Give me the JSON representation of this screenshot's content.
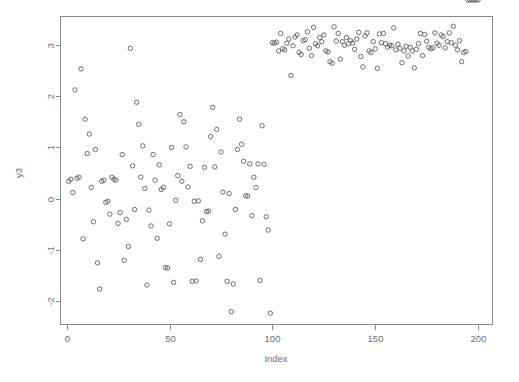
{
  "chart_data": {
    "type": "scatter",
    "title": "",
    "xlabel": "Index",
    "ylabel": "y3",
    "xlim": [
      -3,
      207
    ],
    "ylim": [
      -2.45,
      3.55
    ],
    "grid": false,
    "legend": null,
    "marker": "open-circle",
    "marker_color": "#5d5d5d",
    "xticks": [
      0,
      50,
      100,
      150,
      200
    ],
    "yticks": [
      -2,
      -1,
      0,
      1,
      2,
      3
    ],
    "xtick_labels": [
      "0",
      "50",
      "100",
      "150",
      "200"
    ],
    "ytick_labels": [
      "-2",
      "-1",
      "0",
      "1",
      "2",
      "3"
    ],
    "x": [
      1,
      2,
      3,
      4,
      5,
      6,
      7,
      8,
      9,
      10,
      11,
      12,
      13,
      14,
      15,
      16,
      17,
      18,
      19,
      20,
      21,
      22,
      23,
      24,
      25,
      26,
      27,
      28,
      29,
      30,
      31,
      32,
      33,
      34,
      35,
      36,
      37,
      38,
      39,
      40,
      41,
      42,
      43,
      44,
      45,
      46,
      47,
      48,
      49,
      50,
      51,
      52,
      53,
      54,
      55,
      56,
      57,
      58,
      59,
      60,
      61,
      62,
      63,
      64,
      65,
      66,
      67,
      68,
      69,
      70,
      71,
      72,
      73,
      74,
      75,
      76,
      77,
      78,
      79,
      80,
      81,
      82,
      83,
      84,
      85,
      86,
      87,
      88,
      89,
      90,
      91,
      92,
      93,
      94,
      95,
      96,
      97,
      98,
      99,
      100,
      101,
      102,
      103,
      104,
      105,
      106,
      107,
      108,
      109,
      110,
      111,
      112,
      113,
      114,
      115,
      116,
      117,
      118,
      119,
      120,
      121,
      122,
      123,
      124,
      125,
      126,
      127,
      128,
      129,
      130,
      131,
      132,
      133,
      134,
      135,
      136,
      137,
      138,
      139,
      140,
      141,
      142,
      143,
      144,
      145,
      146,
      147,
      148,
      149,
      150,
      151,
      152,
      153,
      154,
      155,
      156,
      157,
      158,
      159,
      160,
      161,
      162,
      163,
      164,
      165,
      166,
      167,
      168,
      169,
      170,
      171,
      172,
      173,
      174,
      175,
      176,
      177,
      178,
      179,
      180,
      181,
      182,
      183,
      184,
      185,
      186,
      187,
      188,
      189,
      190,
      191,
      192,
      193,
      194,
      195,
      196,
      197,
      198,
      199,
      200
    ],
    "y": [
      0.34,
      0.38,
      0.12,
      2.12,
      0.4,
      0.42,
      2.53,
      -0.78,
      1.55,
      0.88,
      1.26,
      0.22,
      -0.45,
      0.96,
      -1.25,
      -1.76,
      0.34,
      0.36,
      -0.07,
      -0.05,
      -0.3,
      0.42,
      0.38,
      0.36,
      -0.48,
      -0.27,
      0.86,
      -1.2,
      -0.4,
      -0.93,
      2.93,
      0.64,
      -0.21,
      1.88,
      1.45,
      0.42,
      1.03,
      0.2,
      -1.68,
      -0.22,
      -0.53,
      0.86,
      0.36,
      -0.77,
      0.66,
      0.18,
      0.22,
      -1.34,
      -1.35,
      -0.49,
      1.0,
      -1.63,
      -0.03,
      0.45,
      1.64,
      0.34,
      1.5,
      1.01,
      0.23,
      0.63,
      -1.61,
      -0.05,
      -1.6,
      -0.04,
      -1.18,
      -0.43,
      0.61,
      -0.25,
      -0.24,
      1.21,
      1.78,
      0.62,
      1.35,
      -1.12,
      0.91,
      0.13,
      -0.69,
      -1.61,
      0.1,
      -2.2,
      -1.66,
      -0.21,
      0.96,
      1.55,
      1.06,
      0.73,
      0.06,
      0.05,
      0.68,
      -0.33,
      0.42,
      0.22,
      0.68,
      -1.59,
      1.42,
      0.67,
      -0.35,
      -0.61,
      -2.23,
      3.04,
      3.03,
      3.05,
      2.88,
      3.22,
      2.92,
      2.9,
      3.03,
      3.11,
      2.4,
      2.98,
      3.15,
      3.19,
      2.85,
      2.81,
      3.08,
      3.1,
      3.25,
      2.93,
      2.79,
      3.34,
      3.02,
      2.98,
      3.14,
      3.06,
      3.19,
      2.88,
      2.86,
      2.67,
      2.64,
      3.35,
      3.07,
      3.22,
      2.72,
      3.06,
      2.99,
      3.14,
      3.02,
      3.08,
      3.03,
      2.91,
      3.11,
      3.24,
      2.77,
      2.57,
      3.17,
      3.23,
      2.88,
      2.85,
      3.06,
      2.92,
      2.54,
      3.21,
      3.04,
      3.22,
      3.02,
      2.95,
      2.99,
      2.98,
      3.33,
      2.9,
      3.01,
      2.93,
      2.65,
      2.88,
      2.97,
      2.78,
      2.95,
      2.88,
      2.55,
      2.91,
      3.02,
      3.22,
      2.79,
      3.2,
      3.07,
      2.95,
      2.92,
      2.94,
      3.23,
      3.03,
      2.99,
      3.19,
      3.16,
      2.94,
      3.06,
      3.23,
      3.04,
      3.36,
      2.99,
      2.9,
      3.08,
      2.67,
      2.85,
      2.87
    ]
  },
  "axes": {
    "x_title": "Index",
    "y_title": "y3"
  }
}
